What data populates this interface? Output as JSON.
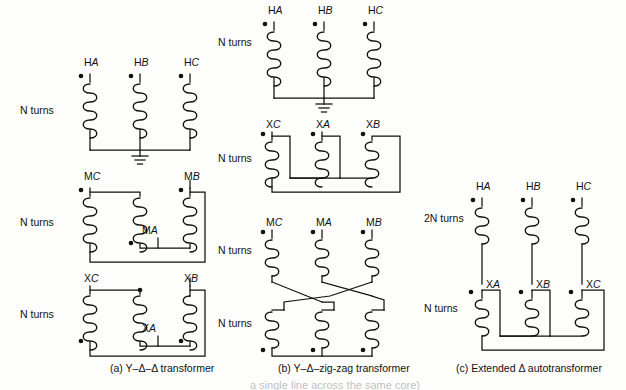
{
  "figure": {
    "title_visible": false,
    "background": "#fdfdfb",
    "ink": "#111111",
    "panels": [
      {
        "id": "a",
        "caption": "(a)  Y–Δ–Δ transformer",
        "caption_x": 110,
        "caption_y": 372,
        "windings": [
          {
            "row": "top",
            "connection": "wye",
            "turns_label": "N turns",
            "turns_x": 20,
            "turns_y": 114,
            "grounded": true,
            "terminals": [
              {
                "name": "HA",
                "letter_h": "H",
                "letter_i": "A",
                "x": 84,
                "y": 66
              },
              {
                "name": "HB",
                "letter_h": "H",
                "letter_i": "B",
                "x": 134,
                "y": 66
              },
              {
                "name": "HC",
                "letter_h": "H",
                "letter_i": "C",
                "x": 184,
                "y": 66
              }
            ]
          },
          {
            "row": "middle",
            "connection": "delta",
            "turns_label": "N turns",
            "turns_x": 20,
            "turns_y": 226,
            "grounded": false,
            "terminals": [
              {
                "name": "MC",
                "letter_h": "M",
                "letter_i": "C",
                "x": 84,
                "y": 180
              },
              {
                "name": "MA",
                "letter_h": "M",
                "letter_i": "A",
                "x": 142,
                "y": 230
              },
              {
                "name": "MB",
                "letter_h": "M",
                "letter_i": "B",
                "x": 184,
                "y": 180
              }
            ]
          },
          {
            "row": "bottom",
            "connection": "delta",
            "turns_label": "N turns",
            "turns_x": 20,
            "turns_y": 318,
            "grounded": false,
            "terminals": [
              {
                "name": "XC",
                "letter_h": "X",
                "letter_i": "C",
                "x": 84,
                "y": 278
              },
              {
                "name": "XA",
                "letter_h": "X",
                "letter_i": "A",
                "x": 142,
                "y": 320
              },
              {
                "name": "XB",
                "letter_h": "X",
                "letter_i": "B",
                "x": 184,
                "y": 278
              }
            ]
          }
        ]
      },
      {
        "id": "b",
        "caption": "(b)  Y–Δ–zig-zag transformer",
        "caption_x": 278,
        "caption_y": 372,
        "windings": [
          {
            "row": "top",
            "connection": "wye",
            "turns_label": "N turns",
            "turns_x": 218,
            "turns_y": 46,
            "grounded": true,
            "terminals": [
              {
                "name": "HA",
                "letter_h": "H",
                "letter_i": "A",
                "x": 268,
                "y": 14
              },
              {
                "name": "HB",
                "letter_h": "H",
                "letter_i": "B",
                "x": 318,
                "y": 14
              },
              {
                "name": "HC",
                "letter_h": "H",
                "letter_i": "C",
                "x": 368,
                "y": 14
              }
            ]
          },
          {
            "row": "middle",
            "connection": "delta",
            "turns_label": "N turns",
            "turns_x": 218,
            "turns_y": 162,
            "grounded": false,
            "terminals": [
              {
                "name": "XC",
                "letter_h": "X",
                "letter_i": "C",
                "x": 266,
                "y": 124
              },
              {
                "name": "XA",
                "letter_h": "X",
                "letter_i": "A",
                "x": 316,
                "y": 124
              },
              {
                "name": "XB",
                "letter_h": "X",
                "letter_i": "B",
                "x": 366,
                "y": 124
              }
            ]
          },
          {
            "row": "zigzag-upper",
            "connection": "zigzag",
            "turns_label": "N turns",
            "turns_x": 218,
            "turns_y": 254,
            "grounded": false,
            "terminals": [
              {
                "name": "MC",
                "letter_h": "M",
                "letter_i": "C",
                "x": 266,
                "y": 222
              },
              {
                "name": "MA",
                "letter_h": "M",
                "letter_i": "A",
                "x": 316,
                "y": 222
              },
              {
                "name": "MB",
                "letter_h": "M",
                "letter_i": "B",
                "x": 366,
                "y": 222
              }
            ]
          },
          {
            "row": "zigzag-lower",
            "connection": "zigzag",
            "turns_label": "N turns",
            "turns_x": 218,
            "turns_y": 327,
            "grounded": false,
            "terminals": []
          }
        ]
      },
      {
        "id": "c",
        "caption": "(c)  Extended Δ autotransformer",
        "caption_x": 456,
        "caption_y": 372,
        "windings": [
          {
            "row": "top",
            "connection": "series",
            "turns_label": "2N turns",
            "turns_x": 424,
            "turns_y": 222,
            "grounded": false,
            "terminals": [
              {
                "name": "HA",
                "letter_h": "H",
                "letter_i": "A",
                "x": 476,
                "y": 190
              },
              {
                "name": "HB",
                "letter_h": "H",
                "letter_i": "B",
                "x": 526,
                "y": 190
              },
              {
                "name": "HC",
                "letter_h": "H",
                "letter_i": "C",
                "x": 576,
                "y": 190
              }
            ]
          },
          {
            "row": "bottom",
            "connection": "delta",
            "turns_label": "N turns",
            "turns_x": 424,
            "turns_y": 312,
            "grounded": false,
            "terminals": [
              {
                "name": "XA",
                "letter_h": "X",
                "letter_i": "A",
                "x": 486,
                "y": 284
              },
              {
                "name": "XB",
                "letter_h": "X",
                "letter_i": "B",
                "x": 536,
                "y": 284
              },
              {
                "name": "XC",
                "letter_h": "X",
                "letter_i": "C",
                "x": 586,
                "y": 284
              }
            ]
          }
        ]
      }
    ],
    "page_tail_text": "a single line across the same core)"
  }
}
